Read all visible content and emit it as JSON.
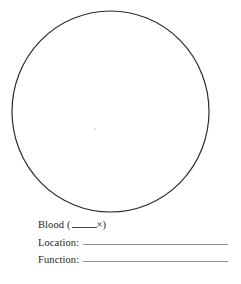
{
  "page": {
    "type": "worksheet",
    "width": 241,
    "height": 284,
    "background_color": "#ffffff"
  },
  "drawing_area": {
    "shape_name": "circle",
    "description": "Large empty hand-drawn circle for sketching a specimen",
    "stroke_color": "#2b2b2b",
    "stroke_width": 1.2,
    "center_x": 110,
    "center_y": 111,
    "radius_x": 99,
    "radius_y": 101
  },
  "form_fields": [
    {
      "label": "Blood (",
      "blank": "_____",
      "suffix_symbol": "×",
      "suffix_close": ")",
      "full_text": "Blood (_____×)",
      "has_long_rule": false
    },
    {
      "label": "Location:",
      "value": "",
      "has_long_rule": true
    },
    {
      "label": "Function:",
      "value": "",
      "has_long_rule": true
    }
  ],
  "colors": {
    "ink": "#1e1e1e",
    "circle_stroke": "#2b2b2b",
    "rule_line": "#8e8e8e",
    "blank_line": "#4a4a4a"
  }
}
